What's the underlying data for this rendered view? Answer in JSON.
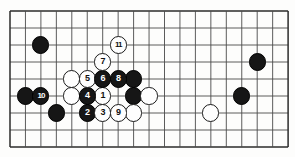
{
  "diagram": {
    "board": {
      "cols": 18,
      "rows": 8,
      "origin_x": 10,
      "origin_y": 11,
      "step_x": 15.45,
      "step_y": 17.0,
      "line_color": "#4a4a4a",
      "border_color": "#2b2b2b",
      "background_color": "#fdfdfc"
    },
    "star_points": [
      {
        "name": "hoshi-center",
        "col": 8,
        "row": 5
      }
    ],
    "stones": [
      {
        "name": "black-stone-upper-left",
        "color": "black",
        "label": "",
        "col": 2,
        "row": 2
      },
      {
        "name": "white-stone-upper",
        "color": "white",
        "label": "",
        "col": 4,
        "row": 4
      },
      {
        "name": "black-stone-right-of-eight",
        "color": "black",
        "label": "",
        "col": 8,
        "row": 4
      },
      {
        "name": "white-stone-left-mid",
        "color": "white",
        "label": "",
        "col": 4,
        "row": 5
      },
      {
        "name": "black-stone-mid",
        "color": "black",
        "label": "",
        "col": 8,
        "row": 5
      },
      {
        "name": "black-stone-far-left-mid",
        "color": "black",
        "label": "",
        "col": 1,
        "row": 5
      },
      {
        "name": "black-stone-lower-left",
        "color": "black",
        "label": "",
        "col": 3,
        "row": 6
      },
      {
        "name": "white-stone-center-right",
        "color": "white",
        "label": "",
        "col": 9,
        "row": 5
      },
      {
        "name": "white-stone-lower-center",
        "color": "white",
        "label": "",
        "col": 8,
        "row": 6
      },
      {
        "name": "white-stone-lower-right",
        "color": "white",
        "label": "",
        "col": 13,
        "row": 6
      },
      {
        "name": "black-stone-far-right-upper",
        "color": "black",
        "label": "",
        "col": 16,
        "row": 3
      },
      {
        "name": "black-stone-far-right-mid",
        "color": "black",
        "label": "",
        "col": 15,
        "row": 5
      },
      {
        "name": "move-1",
        "color": "white",
        "label": "1",
        "col": 6,
        "row": 5
      },
      {
        "name": "move-2",
        "color": "black",
        "label": "2",
        "col": 5,
        "row": 6
      },
      {
        "name": "move-3",
        "color": "white",
        "label": "3",
        "col": 6,
        "row": 6
      },
      {
        "name": "move-4",
        "color": "black",
        "label": "4",
        "col": 5,
        "row": 5
      },
      {
        "name": "move-5",
        "color": "white",
        "label": "5",
        "col": 5,
        "row": 4
      },
      {
        "name": "move-6",
        "color": "black",
        "label": "6",
        "col": 6,
        "row": 4
      },
      {
        "name": "move-7",
        "color": "white",
        "label": "7",
        "col": 6,
        "row": 3
      },
      {
        "name": "move-8",
        "color": "black",
        "label": "8",
        "col": 7,
        "row": 4
      },
      {
        "name": "move-9",
        "color": "white",
        "label": "9",
        "col": 7,
        "row": 6
      },
      {
        "name": "move-10",
        "color": "black",
        "label": "10",
        "col": 2,
        "row": 5
      },
      {
        "name": "move-11",
        "color": "white",
        "label": "11",
        "col": 7,
        "row": 2
      }
    ]
  }
}
